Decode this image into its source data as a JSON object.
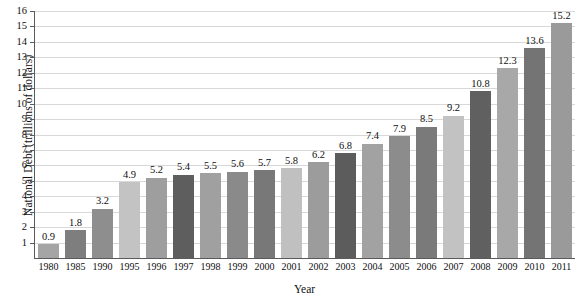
{
  "chart_data": {
    "type": "bar",
    "title": "",
    "xlabel": "Year",
    "ylabel": "National Debt (trillions of dollars)",
    "ylim": [
      0,
      16
    ],
    "ytick_labels": [
      "16",
      "15",
      "14",
      "13",
      "12",
      "11",
      "10",
      "9",
      "8",
      "7",
      "6",
      "5",
      "4",
      "3",
      "2",
      "1"
    ],
    "yticks": [
      16,
      15,
      14,
      13,
      12,
      11,
      10,
      9,
      8,
      7,
      6,
      5,
      4,
      3,
      2,
      1
    ],
    "grid": true,
    "legend": "none",
    "categories": [
      "1980",
      "1985",
      "1990",
      "1995",
      "1996",
      "1997",
      "1998",
      "1999",
      "2000",
      "2001",
      "2002",
      "2003",
      "2004",
      "2005",
      "2006",
      "2007",
      "2008",
      "2009",
      "2010",
      "2011"
    ],
    "values": [
      0.9,
      1.8,
      3.2,
      4.9,
      5.2,
      5.4,
      5.5,
      5.6,
      5.7,
      5.8,
      6.2,
      6.8,
      7.4,
      7.9,
      8.5,
      9.2,
      10.8,
      12.3,
      13.6,
      15.2
    ],
    "value_labels": [
      "0.9",
      "1.8",
      "3.2",
      "4.9",
      "5.2",
      "5.4",
      "5.5",
      "5.6",
      "5.7",
      "5.8",
      "6.2",
      "6.8",
      "7.4",
      "7.9",
      "8.5",
      "9.2",
      "10.8",
      "12.3",
      "13.6",
      "15.2"
    ],
    "bar_colors": [
      "#a5a5a5",
      "#7e7e7e",
      "#8e8e8e",
      "#c3c3c3",
      "#9e9e9e",
      "#5e5e5e",
      "#a0a0a0",
      "#8a8a8a",
      "#787878",
      "#c0c0c0",
      "#9c9c9c",
      "#5c5c5c",
      "#a2a2a2",
      "#8c8c8c",
      "#7a7a7a",
      "#c2c2c2",
      "#606060",
      "#a8a8a8",
      "#747474",
      "#9a9a9a"
    ],
    "palette": {
      "light_gray": "#c3c3c3",
      "medium_gray": "#9c9c9c",
      "dark_gray": "#5e5e5e",
      "axis": "#5a5a5a",
      "gridline": "#d8d8d8",
      "background": "#ffffff",
      "text": "#101010"
    }
  }
}
